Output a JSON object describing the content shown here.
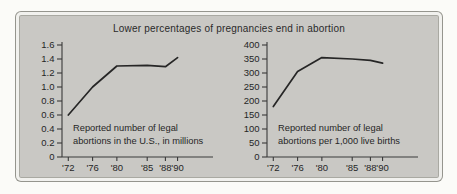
{
  "figure": {
    "title": "Lower percentages of pregnancies end in abortion"
  },
  "colors": {
    "page_bg": "#fbfbf8",
    "panel_bg": "#c9c8c4",
    "panel_border": "#f1f1ee",
    "axis": "#3a3a3a",
    "line": "#262626",
    "text": "#262626"
  },
  "chart_data": [
    {
      "type": "line",
      "name": "legal-abortions-millions",
      "caption_lines": [
        "Reported number of legal",
        "abortions in the U.S., in millions"
      ],
      "x": [
        1972,
        1976,
        1980,
        1985,
        1988,
        1990
      ],
      "x_tick_labels": [
        "'72",
        "'76",
        "'80",
        "'85",
        "'88",
        "'90"
      ],
      "values": [
        0.6,
        1.0,
        1.3,
        1.31,
        1.29,
        1.42
      ],
      "ylim": [
        0,
        1.6
      ],
      "y_tick_labels": [
        "0",
        "0.2",
        "0.4",
        "0.6",
        "0.8",
        "1.0",
        "1.2",
        "1.4",
        "1.6"
      ],
      "grid": false,
      "legend": "none"
    },
    {
      "type": "line",
      "name": "legal-abortions-per-1000-live-births",
      "caption_lines": [
        "Reported number of legal",
        "abortions per 1,000 live births"
      ],
      "x": [
        1972,
        1976,
        1980,
        1985,
        1988,
        1990
      ],
      "x_tick_labels": [
        "'72",
        "'76",
        "'80",
        "'85",
        "'88",
        "'90"
      ],
      "values": [
        180,
        305,
        355,
        350,
        345,
        335
      ],
      "ylim": [
        0,
        400
      ],
      "y_tick_labels": [
        "0",
        "50",
        "100",
        "150",
        "200",
        "250",
        "300",
        "350",
        "400"
      ],
      "grid": false,
      "legend": "none"
    }
  ]
}
